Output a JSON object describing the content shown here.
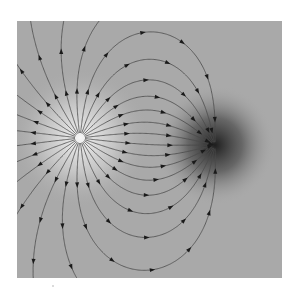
{
  "figure": {
    "background_color": "#a9a9a9",
    "line_color": "#4a4a4a",
    "arrow_color": "#1a1a1a",
    "frame": {
      "x": 17,
      "y": 21,
      "width": 265,
      "height": 257
    },
    "charges": [
      {
        "name": "positive-charge",
        "x": 63,
        "y": 117,
        "q": 1,
        "glow_color": "#f4f4f4",
        "glow_radius": 70
      },
      {
        "name": "negative-charge",
        "x": 198,
        "y": 124,
        "q": -1,
        "glow_color": "#202020",
        "glow_radius": 60
      }
    ],
    "num_lines": 28,
    "arrow_spacing": 42
  }
}
